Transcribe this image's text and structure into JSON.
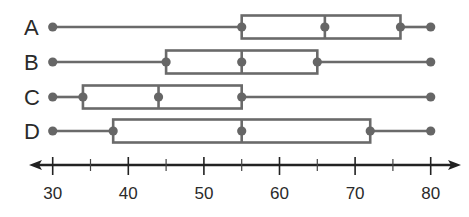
{
  "chart_data": {
    "type": "boxplot",
    "title": "",
    "xlabel": "",
    "ylabel": "",
    "orientation": "horizontal",
    "axis": {
      "min": 30,
      "max": 80,
      "major_ticks": [
        30,
        40,
        50,
        60,
        70,
        80
      ],
      "minor_ticks": [
        35,
        45,
        55,
        65,
        75
      ],
      "tick_labels": [
        "30",
        "40",
        "50",
        "60",
        "70",
        "80"
      ],
      "arrows_both_ends": true
    },
    "grid": false,
    "series": [
      {
        "name": "A",
        "min": 30,
        "q1": 55,
        "median": 66,
        "q3": 76,
        "max": 80
      },
      {
        "name": "B",
        "min": 30,
        "q1": 45,
        "median": 55,
        "q3": 65,
        "max": 80
      },
      {
        "name": "C",
        "min": 30,
        "q1": 34,
        "median": 44,
        "q3": 55,
        "max": 80
      },
      {
        "name": "D",
        "min": 30,
        "q1": 38,
        "median": 55,
        "q3": 72,
        "max": 80
      }
    ]
  },
  "colors": {
    "plot": "#666666",
    "axis": "#222222",
    "text": "#2a2a2a",
    "background": "#ffffff"
  }
}
